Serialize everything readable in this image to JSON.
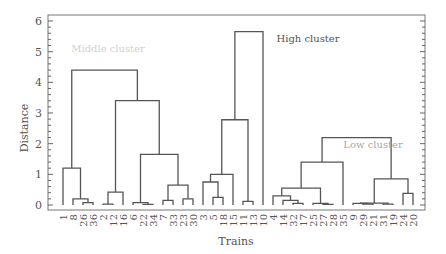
{
  "chart_data": {
    "type": "dendrogram",
    "title": "",
    "xlabel": "Trains",
    "ylabel": "Distance",
    "ylim": [
      0,
      6.2
    ],
    "yticks": [
      0,
      1,
      2,
      3,
      4,
      5,
      6
    ],
    "grid": false,
    "leaves": [
      "1",
      "8",
      "26",
      "36",
      "2",
      "12",
      "16",
      "6",
      "22",
      "34",
      "7",
      "33",
      "23",
      "30",
      "3",
      "5",
      "18",
      "15",
      "11",
      "13",
      "10",
      "4",
      "14",
      "32",
      "17",
      "25",
      "27",
      "28",
      "35",
      "9",
      "29",
      "21",
      "31",
      "19",
      "24",
      "20"
    ],
    "annotations": [
      {
        "text": "Middle cluster",
        "x_leaf": 4.5,
        "y": 5.0,
        "color": "#d0d0d0"
      },
      {
        "text": "High cluster",
        "x_leaf": 24.5,
        "y": 5.3,
        "color": "#555555"
      },
      {
        "text": "Low cluster",
        "x_leaf": 31.0,
        "y": 1.85,
        "color": "#a8a8a8"
      }
    ],
    "merges": [
      {
        "a": "L:26",
        "b": "L:36",
        "h": 0.08,
        "id": "m1"
      },
      {
        "a": "L:8",
        "b": "m1",
        "h": 0.2,
        "id": "m2"
      },
      {
        "a": "L:1",
        "b": "m2",
        "h": 1.2,
        "id": "m3"
      },
      {
        "a": "L:2",
        "b": "L:12",
        "h": 0.03,
        "id": "m4"
      },
      {
        "a": "m4",
        "b": "L:16",
        "h": 0.42,
        "id": "m5"
      },
      {
        "a": "L:22",
        "b": "L:34",
        "h": 0.02,
        "id": "m6"
      },
      {
        "a": "L:6",
        "b": "m6",
        "h": 0.08,
        "id": "m7"
      },
      {
        "a": "L:7",
        "b": "L:33",
        "h": 0.15,
        "id": "m8"
      },
      {
        "a": "L:23",
        "b": "L:30",
        "h": 0.2,
        "id": "m9"
      },
      {
        "a": "m8",
        "b": "m9",
        "h": 0.65,
        "id": "m10"
      },
      {
        "a": "m7",
        "b": "m10",
        "h": 1.65,
        "id": "m11"
      },
      {
        "a": "m5",
        "b": "m11",
        "h": 3.4,
        "id": "m12"
      },
      {
        "a": "m3",
        "b": "m12",
        "h": 4.4,
        "id": "m13"
      },
      {
        "a": "L:5",
        "b": "L:18",
        "h": 0.25,
        "id": "m14"
      },
      {
        "a": "L:3",
        "b": "m14",
        "h": 0.75,
        "id": "m15"
      },
      {
        "a": "m15",
        "b": "L:15",
        "h": 1.0,
        "id": "m16"
      },
      {
        "a": "L:11",
        "b": "L:13",
        "h": 0.12,
        "id": "m17"
      },
      {
        "a": "m16",
        "b": "m17",
        "h": 2.78,
        "id": "m18"
      },
      {
        "a": "m18",
        "b": "L:10",
        "h": 5.65,
        "id": "m19"
      },
      {
        "a": "L:32",
        "b": "L:17",
        "h": 0.05,
        "id": "m20"
      },
      {
        "a": "L:14",
        "b": "m20",
        "h": 0.15,
        "id": "m21"
      },
      {
        "a": "L:4",
        "b": "m21",
        "h": 0.3,
        "id": "m22"
      },
      {
        "a": "L:27",
        "b": "L:28",
        "h": 0.02,
        "id": "m23"
      },
      {
        "a": "L:25",
        "b": "m23",
        "h": 0.05,
        "id": "m24"
      },
      {
        "a": "m22",
        "b": "m24",
        "h": 0.55,
        "id": "m25"
      },
      {
        "a": "m25",
        "b": "L:35",
        "h": 1.4,
        "id": "m26"
      },
      {
        "a": "L:29",
        "b": "L:21",
        "h": 0.03,
        "id": "m27"
      },
      {
        "a": "L:9",
        "b": "m27",
        "h": 0.05,
        "id": "m28"
      },
      {
        "a": "L:31",
        "b": "L:19",
        "h": 0.03,
        "id": "m29"
      },
      {
        "a": "m28",
        "b": "m29",
        "h": 0.06,
        "id": "m30"
      },
      {
        "a": "L:24",
        "b": "L:20",
        "h": 0.38,
        "id": "m31"
      },
      {
        "a": "m30",
        "b": "m31",
        "h": 0.85,
        "id": "m32"
      },
      {
        "a": "m26",
        "b": "m32",
        "h": 2.2,
        "id": "m33"
      }
    ]
  },
  "colors": {
    "line": "#555555",
    "axis": "#666666",
    "text": "#555555"
  }
}
